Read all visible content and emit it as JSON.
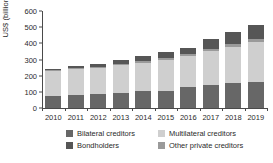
{
  "chart_data": {
    "type": "bar",
    "stacked": true,
    "title": "",
    "xlabel": "",
    "ylabel": "US$ (billion)",
    "ylim": [
      0,
      600
    ],
    "yticks": [
      0,
      100,
      200,
      300,
      400,
      500,
      600
    ],
    "grid": false,
    "legend_position": "bottom",
    "categories": [
      "2010",
      "2011",
      "2012",
      "2013",
      "2014",
      "2015",
      "2016",
      "2017",
      "2018",
      "2019"
    ],
    "series": [
      {
        "name": "Bilateral creditors",
        "color": "#676767",
        "values": [
          72,
          82,
          86,
          92,
          103,
          108,
          127,
          142,
          155,
          164
        ]
      },
      {
        "name": "Multilateral creditors",
        "color": "#cfcfcf",
        "values": [
          155,
          157,
          161,
          175,
          176,
          190,
          196,
          208,
          225,
          245
        ]
      },
      {
        "name": "Other private creditors",
        "color": "#9a9a9a",
        "values": [
          6,
          6,
          7,
          8,
          10,
          12,
          14,
          16,
          18,
          20
        ]
      },
      {
        "name": "Bondholders",
        "color": "#565656",
        "values": [
          11,
          15,
          21,
          23,
          33,
          35,
          35,
          62,
          73,
          82
        ]
      }
    ],
    "totals": [
      244,
      260,
      275,
      298,
      322,
      345,
      372,
      428,
      471,
      511
    ]
  },
  "legend": {
    "entries": [
      {
        "label": "Bilateral creditors",
        "color": "#676767"
      },
      {
        "label": "Multilateral creditors",
        "color": "#cfcfcf"
      },
      {
        "label": "Bondholders",
        "color": "#565656"
      },
      {
        "label": "Other private creditors",
        "color": "#9a9a9a"
      }
    ]
  }
}
